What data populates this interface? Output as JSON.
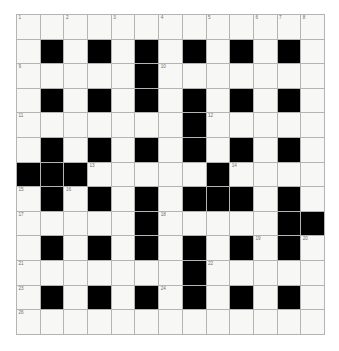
{
  "puzzle": {
    "kind": "crossword-grid",
    "rows": 13,
    "cols": 13,
    "cell_white_color": "#f7f7f5",
    "cell_black_color": "#000000",
    "grid_line_color": "#b4b4b4",
    "grid_border_color": "#8c8c8c",
    "number_color": "#6e6e6e",
    "background_color": "#ffffff",
    "grid": [
      [
        "W",
        "W",
        "W",
        "W",
        "W",
        "W",
        "W",
        "W",
        "W",
        "W",
        "W",
        "W",
        "W"
      ],
      [
        "W",
        "B",
        "W",
        "B",
        "W",
        "B",
        "W",
        "B",
        "W",
        "B",
        "W",
        "B",
        "W"
      ],
      [
        "W",
        "W",
        "W",
        "W",
        "W",
        "B",
        "W",
        "W",
        "W",
        "W",
        "W",
        "W",
        "W"
      ],
      [
        "W",
        "B",
        "W",
        "B",
        "W",
        "B",
        "W",
        "B",
        "W",
        "B",
        "W",
        "B",
        "W"
      ],
      [
        "W",
        "W",
        "W",
        "W",
        "W",
        "W",
        "W",
        "B",
        "W",
        "W",
        "W",
        "W",
        "W"
      ],
      [
        "W",
        "B",
        "W",
        "B",
        "W",
        "B",
        "W",
        "B",
        "W",
        "B",
        "W",
        "B",
        "W"
      ],
      [
        "B",
        "B",
        "B",
        "W",
        "W",
        "W",
        "W",
        "W",
        "B",
        "W",
        "W",
        "W",
        "W"
      ],
      [
        "W",
        "B",
        "W",
        "B",
        "W",
        "B",
        "W",
        "B",
        "B",
        "B",
        "W",
        "B",
        "W"
      ],
      [
        "W",
        "W",
        "W",
        "W",
        "W",
        "B",
        "W",
        "W",
        "W",
        "W",
        "W",
        "B",
        "B"
      ],
      [
        "W",
        "B",
        "W",
        "B",
        "W",
        "B",
        "W",
        "B",
        "W",
        "B",
        "W",
        "B",
        "W"
      ],
      [
        "W",
        "W",
        "W",
        "W",
        "W",
        "W",
        "W",
        "B",
        "W",
        "W",
        "W",
        "W",
        "W"
      ],
      [
        "W",
        "B",
        "W",
        "B",
        "W",
        "B",
        "W",
        "B",
        "W",
        "B",
        "W",
        "B",
        "W"
      ],
      [
        "W",
        "W",
        "W",
        "W",
        "W",
        "W",
        "W",
        "W",
        "W",
        "W",
        "W",
        "W",
        "W"
      ]
    ],
    "numbers": [
      {
        "row": 0,
        "col": 0,
        "label": "1"
      },
      {
        "row": 0,
        "col": 2,
        "label": "2"
      },
      {
        "row": 0,
        "col": 4,
        "label": "3"
      },
      {
        "row": 0,
        "col": 6,
        "label": "4"
      },
      {
        "row": 0,
        "col": 8,
        "label": "5"
      },
      {
        "row": 0,
        "col": 10,
        "label": "6"
      },
      {
        "row": 0,
        "col": 11,
        "label": "7"
      },
      {
        "row": 0,
        "col": 12,
        "label": "8"
      },
      {
        "row": 2,
        "col": 0,
        "label": "9"
      },
      {
        "row": 2,
        "col": 6,
        "label": "10"
      },
      {
        "row": 4,
        "col": 0,
        "label": "11"
      },
      {
        "row": 4,
        "col": 8,
        "label": "12"
      },
      {
        "row": 6,
        "col": 3,
        "label": "13"
      },
      {
        "row": 6,
        "col": 9,
        "label": "14"
      },
      {
        "row": 7,
        "col": 0,
        "label": "15"
      },
      {
        "row": 7,
        "col": 2,
        "label": "16"
      },
      {
        "row": 8,
        "col": 0,
        "label": "17"
      },
      {
        "row": 8,
        "col": 6,
        "label": "18"
      },
      {
        "row": 9,
        "col": 10,
        "label": "19"
      },
      {
        "row": 9,
        "col": 12,
        "label": "20"
      },
      {
        "row": 10,
        "col": 0,
        "label": "21"
      },
      {
        "row": 10,
        "col": 8,
        "label": "22"
      },
      {
        "row": 12,
        "col": 0,
        "label": "23"
      },
      {
        "row": 11,
        "col": 6,
        "label": "24"
      },
      {
        "row": 11,
        "col": 9,
        "label": "25"
      },
      {
        "row": 12,
        "col": 0,
        "label": "26"
      }
    ],
    "numbers_override": [
      {
        "row": 0,
        "col": 0,
        "label": "1"
      },
      {
        "row": 0,
        "col": 2,
        "label": "2"
      },
      {
        "row": 0,
        "col": 4,
        "label": "3"
      },
      {
        "row": 0,
        "col": 6,
        "label": "4"
      },
      {
        "row": 0,
        "col": 8,
        "label": "5"
      },
      {
        "row": 0,
        "col": 10,
        "label": "6"
      },
      {
        "row": 0,
        "col": 11,
        "label": "7"
      },
      {
        "row": 0,
        "col": 12,
        "label": "8"
      },
      {
        "row": 2,
        "col": 0,
        "label": "9"
      },
      {
        "row": 2,
        "col": 6,
        "label": "10"
      },
      {
        "row": 4,
        "col": 0,
        "label": "11"
      },
      {
        "row": 4,
        "col": 8,
        "label": "12"
      },
      {
        "row": 6,
        "col": 3,
        "label": "13"
      },
      {
        "row": 6,
        "col": 9,
        "label": "14"
      },
      {
        "row": 7,
        "col": 0,
        "label": "15"
      },
      {
        "row": 7,
        "col": 2,
        "label": "16"
      },
      {
        "row": 8,
        "col": 0,
        "label": "17"
      },
      {
        "row": 8,
        "col": 6,
        "label": "18"
      },
      {
        "row": 9,
        "col": 10,
        "label": "19"
      },
      {
        "row": 9,
        "col": 12,
        "label": "20"
      },
      {
        "row": 10,
        "col": 0,
        "label": "21"
      },
      {
        "row": 10,
        "col": 8,
        "label": "22"
      },
      {
        "row": 11,
        "col": 0,
        "label": "23"
      },
      {
        "row": 11,
        "col": 6,
        "label": "24"
      },
      {
        "row": 11,
        "col": 9,
        "label": "25"
      },
      {
        "row": 12,
        "col": 0,
        "label": "26"
      }
    ]
  }
}
